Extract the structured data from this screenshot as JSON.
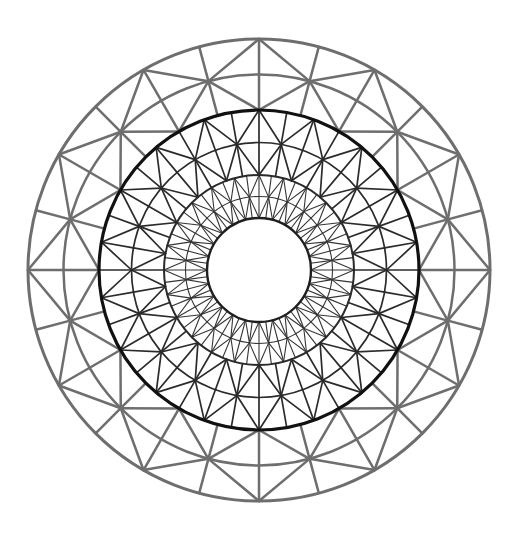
{
  "figure": {
    "background_color": "#ffffff",
    "canvas": {
      "width": 529,
      "height": 544
    }
  },
  "geometry": {
    "center_x": 259,
    "center_y": 270,
    "outer_radius": 231,
    "inner_radius": 52,
    "zone_boundary_radii": [
      52,
      95,
      160,
      231
    ]
  },
  "style": {
    "outer_zone_color": "#6e6e6e",
    "middle_zone_color": "#2b2b2b",
    "inner_zone_color": "#353535",
    "boundary_circle_color": "#1a1a1a",
    "outer_boundary_color": "#6e6e6e",
    "middle_boundary_color": "#111111",
    "inner_boundary_color": "#2a2a2a",
    "hole_boundary_color": "#1f1f1f",
    "outer_zone_width": 2.5,
    "middle_zone_width": 1.7,
    "inner_zone_width": 1.1,
    "outer_boundary_width": 3.0,
    "middle_boundary_width": 3.2,
    "inner_boundary_width": 2.0,
    "hole_boundary_width": 2.4
  },
  "chart_data": {
    "type": "diagram",
    "xlabel": "",
    "ylabel": "",
    "mesh": {
      "domain": "circular annulus",
      "element_type": "linear triangle",
      "zone_count": 3,
      "zones": [
        {
          "name": "inner-zone",
          "r_inner": 52,
          "r_outer": 95,
          "angular_divisions": 48,
          "radial_layers": 2,
          "triangle_count": 192,
          "stroke_color": "#353535",
          "stroke_width": 1.1,
          "refinement": "fine"
        },
        {
          "name": "middle-zone",
          "r_inner": 95,
          "r_outer": 160,
          "angular_divisions": 36,
          "radial_layers": 2,
          "triangle_count": 144,
          "stroke_color": "#2b2b2b",
          "stroke_width": 1.7,
          "refinement": "medium"
        },
        {
          "name": "outer-zone",
          "r_inner": 160,
          "r_outer": 231,
          "angular_divisions": 24,
          "radial_layers": 2,
          "triangle_count": 96,
          "stroke_color": "#6e6e6e",
          "stroke_width": 2.5,
          "refinement": "coarse"
        }
      ],
      "total_triangles": 432,
      "boundary_circles": [
        {
          "name": "hole-boundary",
          "radius": 52,
          "emphasis": "medium"
        },
        {
          "name": "inner-interface",
          "radius": 95,
          "emphasis": "medium"
        },
        {
          "name": "middle-interface",
          "radius": 160,
          "emphasis": "heavy"
        },
        {
          "name": "outer-boundary",
          "radius": 231,
          "emphasis": "medium"
        }
      ]
    }
  }
}
